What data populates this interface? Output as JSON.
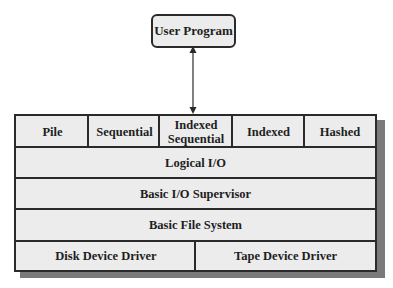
{
  "diagram": {
    "top_node": {
      "label": "User Program"
    },
    "connector": {
      "type": "bidirectional-arrow",
      "from": "User Program",
      "to": "file-organization-layer"
    },
    "layers": [
      {
        "name": "file-organization-layer",
        "cells": [
          {
            "label": "Pile"
          },
          {
            "label": "Sequential"
          },
          {
            "label": "Indexed Sequential",
            "line1": "Indexed",
            "line2": "Sequential"
          },
          {
            "label": "Indexed"
          },
          {
            "label": "Hashed"
          }
        ]
      },
      {
        "name": "logical-io-layer",
        "label": "Logical I/O"
      },
      {
        "name": "basic-io-supervisor-layer",
        "label": "Basic I/O Supervisor"
      },
      {
        "name": "basic-file-system-layer",
        "label": "Basic File System"
      },
      {
        "name": "device-driver-layer",
        "cells": [
          {
            "label": "Disk Device Driver"
          },
          {
            "label": "Tape Device Driver"
          }
        ]
      }
    ],
    "colors": {
      "box_fill": "#ececec",
      "border": "#2a2a2a",
      "shadow": "#7a7a7a",
      "text": "#1e1e1e"
    }
  }
}
